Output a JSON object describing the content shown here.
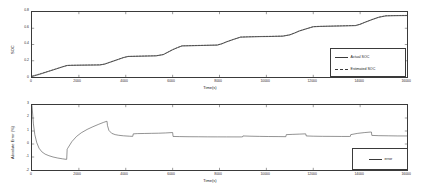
{
  "figure": {
    "background": "#ffffff",
    "line_color": "#3a3a3a"
  },
  "chart_data": [
    {
      "type": "line",
      "id": "soc-plot",
      "title": "",
      "xlabel": "Time(s)",
      "ylabel": "SOC",
      "xlim": [
        0,
        16000
      ],
      "ylim": [
        0,
        0.8
      ],
      "grid": false,
      "xticks": [
        0,
        2000,
        4000,
        6000,
        8000,
        10000,
        12000,
        14000,
        16000
      ],
      "xticklabels": [
        "0",
        "2000",
        "4000",
        "6000",
        "8000",
        "10000",
        "12000",
        "14000",
        "16000"
      ],
      "yticks": [
        0,
        0.2,
        0.4,
        0.6,
        0.8
      ],
      "yticklabels": [
        "0",
        "0.2",
        "0.4",
        "0.6",
        "0.8"
      ],
      "legend_position": "lower-right",
      "series": [
        {
          "name": "Actual SOC",
          "style": "solid",
          "x": [
            0,
            200,
            400,
            700,
            1000,
            1300,
            1500,
            1700,
            1900,
            2100,
            2400,
            2700,
            2900,
            3100,
            3300,
            3500,
            3700,
            3900,
            4100,
            4400,
            4700,
            5000,
            5300,
            5600,
            5800,
            6000,
            6200,
            6400,
            6700,
            7000,
            7300,
            7600,
            7900,
            8100,
            8300,
            8600,
            8900,
            9200,
            9500,
            9800,
            10100,
            10400,
            10700,
            11000,
            11200,
            11400,
            11700,
            12000,
            12300,
            12600,
            12900,
            13200,
            13500,
            13800,
            14000,
            14200,
            14500,
            14800,
            15100,
            15400,
            15700,
            16000
          ],
          "y": [
            0.005,
            0.022,
            0.04,
            0.068,
            0.096,
            0.124,
            0.141,
            0.143,
            0.144,
            0.145,
            0.146,
            0.147,
            0.148,
            0.158,
            0.178,
            0.198,
            0.218,
            0.238,
            0.252,
            0.254,
            0.256,
            0.258,
            0.26,
            0.275,
            0.305,
            0.335,
            0.36,
            0.382,
            0.384,
            0.386,
            0.388,
            0.39,
            0.392,
            0.408,
            0.432,
            0.462,
            0.49,
            0.493,
            0.495,
            0.497,
            0.498,
            0.5,
            0.502,
            0.518,
            0.54,
            0.565,
            0.592,
            0.618,
            0.622,
            0.624,
            0.626,
            0.628,
            0.63,
            0.632,
            0.648,
            0.672,
            0.705,
            0.735,
            0.752,
            0.754,
            0.755,
            0.756
          ]
        },
        {
          "name": "Estimated SOC",
          "style": "dashed",
          "x": [
            0,
            200,
            400,
            700,
            1000,
            1300,
            1500,
            1700,
            1900,
            2100,
            2400,
            2700,
            2900,
            3100,
            3300,
            3500,
            3700,
            3900,
            4100,
            4400,
            4700,
            5000,
            5300,
            5600,
            5800,
            6000,
            6200,
            6400,
            6700,
            7000,
            7300,
            7600,
            7900,
            8100,
            8300,
            8600,
            8900,
            9200,
            9500,
            9800,
            10100,
            10400,
            10700,
            11000,
            11200,
            11400,
            11700,
            12000,
            12300,
            12600,
            12900,
            13200,
            13500,
            13800,
            14000,
            14200,
            14500,
            14800,
            15100,
            15400,
            15700,
            16000
          ],
          "y": [
            0.012,
            0.027,
            0.044,
            0.071,
            0.098,
            0.126,
            0.143,
            0.145,
            0.146,
            0.147,
            0.148,
            0.149,
            0.15,
            0.16,
            0.18,
            0.2,
            0.22,
            0.24,
            0.254,
            0.256,
            0.258,
            0.26,
            0.262,
            0.277,
            0.307,
            0.337,
            0.362,
            0.384,
            0.386,
            0.388,
            0.39,
            0.392,
            0.394,
            0.41,
            0.434,
            0.464,
            0.492,
            0.495,
            0.497,
            0.499,
            0.5,
            0.502,
            0.504,
            0.52,
            0.542,
            0.567,
            0.594,
            0.62,
            0.624,
            0.626,
            0.628,
            0.63,
            0.632,
            0.634,
            0.65,
            0.674,
            0.707,
            0.737,
            0.754,
            0.756,
            0.757,
            0.758
          ]
        }
      ]
    },
    {
      "type": "line",
      "id": "error-plot",
      "title": "",
      "xlabel": "Time(s)",
      "ylabel": "Absolute Error (%)",
      "xlim": [
        0,
        16000
      ],
      "ylim": [
        -2,
        3
      ],
      "grid": false,
      "xticks": [
        0,
        2000,
        4000,
        6000,
        8000,
        10000,
        12000,
        14000,
        16000
      ],
      "xticklabels": [
        "0",
        "2000",
        "4000",
        "6000",
        "8000",
        "10000",
        "12000",
        "14000",
        "16000"
      ],
      "yticks": [
        -2,
        -1,
        0,
        1,
        2,
        3
      ],
      "yticklabels": [
        "-2",
        "-1",
        "0",
        "1",
        "2",
        "3"
      ],
      "legend_position": "lower-right",
      "series": [
        {
          "name": "error",
          "style": "solid",
          "x": [
            0,
            60,
            120,
            200,
            300,
            420,
            560,
            720,
            900,
            1100,
            1300,
            1450,
            1480,
            1500,
            1520,
            1700,
            1900,
            2100,
            2350,
            2600,
            2850,
            3050,
            3180,
            3200,
            3220,
            3280,
            3400,
            3550,
            3700,
            3900,
            4150,
            4280,
            4300,
            4320,
            4500,
            4800,
            5100,
            5400,
            5700,
            5980,
            6000,
            6020,
            6300,
            6700,
            7100,
            7500,
            7900,
            8300,
            8700,
            8950,
            8980,
            9000,
            9300,
            9700,
            10100,
            10500,
            10800,
            10830,
            10850,
            11100,
            11400,
            11650,
            11680,
            11700,
            12000,
            12400,
            12800,
            13200,
            13550,
            13580,
            13600,
            13900,
            14200,
            14450,
            14480,
            14500,
            14800,
            15200,
            15600,
            16000
          ],
          "y": [
            2.95,
            1.55,
            0.72,
            0.12,
            -0.32,
            -0.6,
            -0.78,
            -0.9,
            -1.0,
            -1.08,
            -1.14,
            -1.18,
            -1.18,
            -0.4,
            -0.34,
            0.18,
            0.58,
            0.86,
            1.12,
            1.33,
            1.52,
            1.66,
            1.74,
            1.75,
            1.42,
            1.05,
            0.82,
            0.72,
            0.67,
            0.63,
            0.6,
            0.59,
            0.59,
            0.78,
            0.8,
            0.81,
            0.82,
            0.83,
            0.85,
            0.88,
            0.88,
            0.58,
            0.57,
            0.56,
            0.555,
            0.55,
            0.548,
            0.546,
            0.545,
            0.545,
            0.545,
            0.62,
            0.6,
            0.585,
            0.575,
            0.57,
            0.565,
            0.565,
            0.72,
            0.74,
            0.76,
            0.78,
            0.78,
            0.62,
            0.6,
            0.59,
            0.585,
            0.58,
            0.58,
            0.58,
            0.72,
            0.82,
            0.88,
            0.92,
            0.92,
            0.66,
            0.64,
            0.63,
            0.62,
            0.62
          ]
        }
      ]
    }
  ],
  "legends": {
    "soc": {
      "actual_label": "Actual SOC",
      "estimated_label": "Estimated SOC"
    },
    "error": {
      "error_label": "error"
    }
  }
}
